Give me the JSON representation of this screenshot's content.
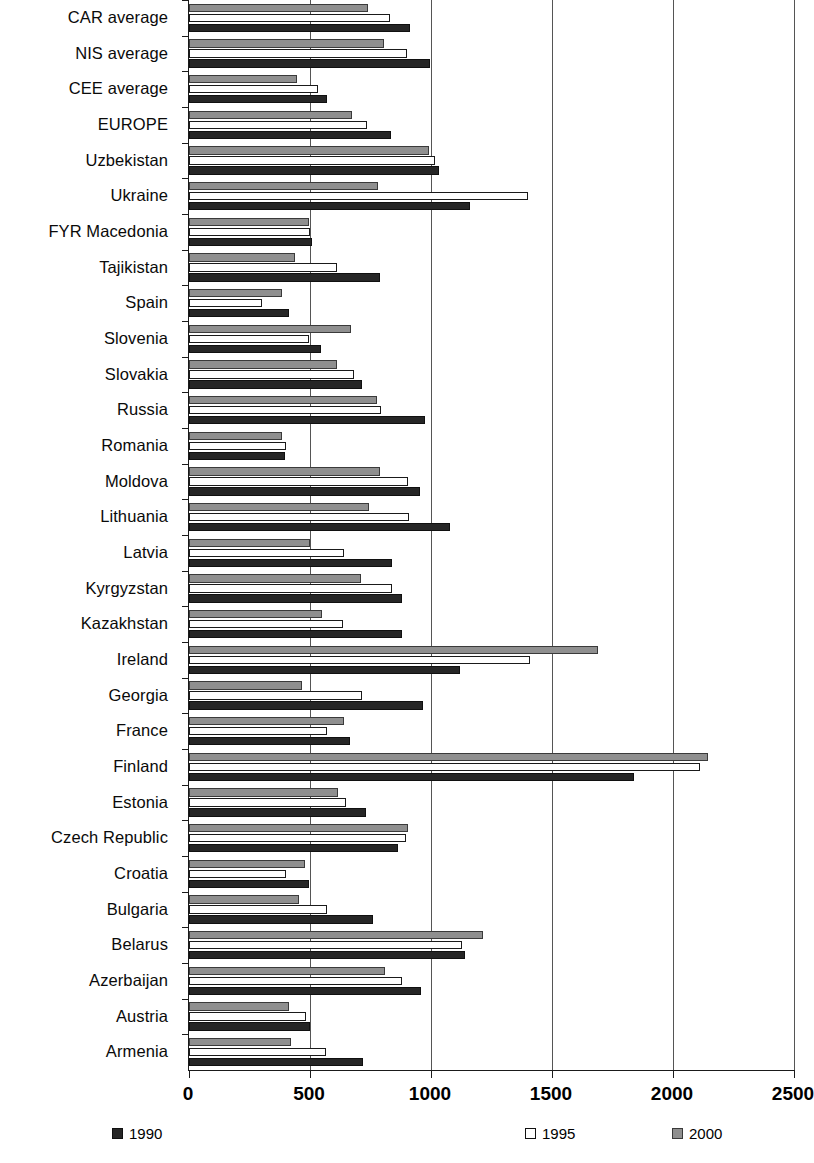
{
  "chart_data": {
    "type": "bar",
    "orientation": "horizontal",
    "title": "",
    "subtitle": "",
    "xlabel": "",
    "ylabel": "",
    "xlim": [
      0,
      2500
    ],
    "xticks": [
      0,
      500,
      1000,
      1500,
      2000,
      2500
    ],
    "xtick_labels": [
      "0",
      "500",
      "1000",
      "1500",
      "2000",
      "2500"
    ],
    "grid": true,
    "grid_axis": "x",
    "legend_position": "bottom",
    "categories": [
      "CAR average",
      "NIS average",
      "CEE average",
      "EUROPE",
      "Uzbekistan",
      "Ukraine",
      "FYR Macedonia",
      "Tajikistan",
      "Spain",
      "Slovenia",
      "Slovakia",
      "Russia",
      "Romania",
      "Moldova",
      "Lithuania",
      "Latvia",
      "Kyrgyzstan",
      "Kazakhstan",
      "Ireland",
      "Georgia",
      "France",
      "Finland",
      "Estonia",
      "Czech Republic",
      "Croatia",
      "Bulgaria",
      "Belarus",
      "Azerbaijan",
      "Austria",
      "Armenia"
    ],
    "series": [
      {
        "name": "1990",
        "color": "#262626",
        "values": [
          915,
          995,
          570,
          835,
          1035,
          1160,
          510,
          790,
          415,
          545,
          715,
          975,
          395,
          955,
          1080,
          840,
          880,
          880,
          1120,
          965,
          665,
          1840,
          730,
          865,
          495,
          760,
          1140,
          960,
          500,
          720
        ]
      },
      {
        "name": "1995",
        "color": "#ffffff",
        "values": [
          830,
          900,
          535,
          735,
          1015,
          1400,
          500,
          610,
          300,
          495,
          680,
          795,
          400,
          905,
          910,
          640,
          840,
          635,
          1410,
          715,
          570,
          2110,
          650,
          895,
          400,
          570,
          1130,
          880,
          485,
          565
        ]
      },
      {
        "name": "2000",
        "color": "#8f8f8f",
        "values": [
          740,
          805,
          445,
          675,
          990,
          780,
          495,
          440,
          385,
          670,
          610,
          775,
          385,
          790,
          745,
          500,
          710,
          550,
          1690,
          465,
          640,
          2145,
          615,
          905,
          480,
          455,
          1215,
          810,
          415,
          420
        ]
      }
    ],
    "legend": [
      {
        "label": "1990",
        "swatch": "dark"
      },
      {
        "label": "1995",
        "swatch": "open"
      },
      {
        "label": "2000",
        "swatch": "gray"
      }
    ]
  }
}
